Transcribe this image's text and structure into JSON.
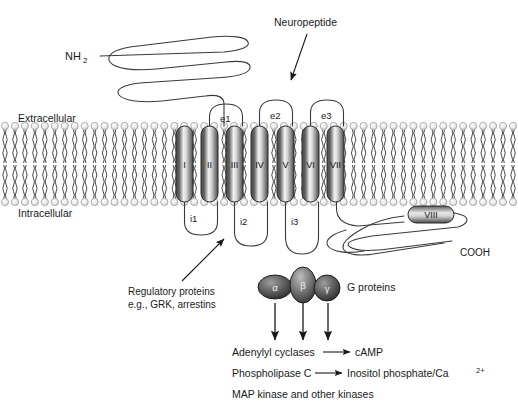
{
  "figure": {
    "background_color": "#ffffff",
    "line_color": "#3a3a3a",
    "text_color": "#1a1a1a"
  },
  "labels": {
    "n_terminus": "NH",
    "n_terminus_sub": "2",
    "c_terminus": "COOH",
    "extracellular": "Extracellular",
    "intracellular": "Intracellular",
    "ligand": "Neuropeptide",
    "g_proteins": "G proteins",
    "regulatory_line1": "Regulatory proteins",
    "regulatory_line2": "e.g., GRK, arrestins"
  },
  "helices": [
    {
      "id": "I",
      "label": "I",
      "x": 176,
      "y": 126,
      "w": 17,
      "h": 76
    },
    {
      "id": "II",
      "label": "II",
      "x": 201,
      "y": 126,
      "w": 17,
      "h": 76
    },
    {
      "id": "III",
      "label": "III",
      "x": 226,
      "y": 126,
      "w": 17,
      "h": 76
    },
    {
      "id": "IV",
      "label": "IV",
      "x": 251,
      "y": 126,
      "w": 17,
      "h": 76
    },
    {
      "id": "V",
      "label": "V",
      "x": 277,
      "y": 126,
      "w": 17,
      "h": 76
    },
    {
      "id": "VI",
      "label": "VI",
      "x": 302,
      "y": 126,
      "w": 17,
      "h": 76
    },
    {
      "id": "VII",
      "label": "VII",
      "x": 327,
      "y": 126,
      "w": 17,
      "h": 76
    }
  ],
  "helix_viii": {
    "label": "VIII",
    "x": 408,
    "y": 206,
    "w": 46,
    "h": 17
  },
  "extracellular_loops": [
    {
      "label": "e1",
      "x": 228,
      "y": 119
    },
    {
      "label": "e2",
      "x": 278,
      "y": 117
    },
    {
      "label": "e3",
      "x": 329,
      "y": 117
    }
  ],
  "intracellular_loops": [
    {
      "label": "i1",
      "x": 196,
      "y": 219
    },
    {
      "label": "i2",
      "x": 246,
      "y": 222
    },
    {
      "label": "i3",
      "x": 296,
      "y": 222
    }
  ],
  "g_protein_subunits": [
    {
      "label": "α",
      "cx": 275,
      "cy": 287,
      "rx": 17,
      "ry": 12
    },
    {
      "label": "β",
      "cx": 303,
      "cy": 285,
      "rx": 13,
      "ry": 18
    },
    {
      "label": "γ",
      "cx": 327,
      "cy": 288,
      "rx": 13,
      "ry": 13
    }
  ],
  "effector_pathways": [
    {
      "source": "Adenylyl cyclases",
      "arrow": "→",
      "target": "cAMP",
      "has_arrow": true
    },
    {
      "source": "Phospholipase C",
      "arrow": "→",
      "target": "Inositol phosphate/Ca",
      "target_sup": "2+",
      "has_arrow": true
    },
    {
      "source": "MAP kinase and other kinases",
      "arrow": "",
      "target": "",
      "has_arrow": false
    }
  ],
  "membrane": {
    "head_count": 52,
    "head_radius": 3.6,
    "top_head_y": 126,
    "bottom_head_y": 202,
    "head_fill": "#e6e6e6",
    "head_stroke": "#9a9a9a"
  },
  "colors": {
    "helix_dark": "#4a4a4a",
    "helix_light": "#f2f2f2",
    "helix_edge": "#2b2b2b",
    "membrane_head": "#e6e6e6",
    "arrow": "#1a1a1a"
  }
}
